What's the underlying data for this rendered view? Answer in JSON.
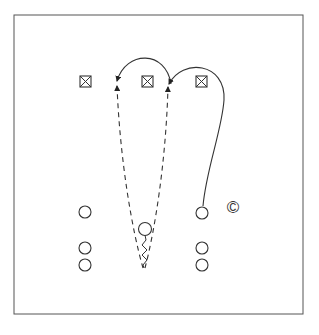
{
  "diagram": {
    "type": "play-diagram",
    "frame": {
      "x": 14,
      "y": 15,
      "width": 289,
      "height": 299,
      "stroke": "#555555"
    },
    "defenders": [
      {
        "id": "d1",
        "symbol": "boxed-x",
        "x": 85.5,
        "y": 81.5
      },
      {
        "id": "d2",
        "symbol": "boxed-x",
        "x": 147.5,
        "y": 81.5
      },
      {
        "id": "d3",
        "symbol": "boxed-x",
        "x": 201.5,
        "y": 81.5
      }
    ],
    "players": [
      {
        "id": "left-1",
        "x": 85,
        "y": 212
      },
      {
        "id": "left-2",
        "x": 85,
        "y": 248
      },
      {
        "id": "left-3",
        "x": 85,
        "y": 265
      },
      {
        "id": "center",
        "x": 145,
        "y": 229
      },
      {
        "id": "right-1",
        "x": 202,
        "y": 213
      },
      {
        "id": "right-2",
        "x": 202,
        "y": 248
      },
      {
        "id": "right-3",
        "x": 202,
        "y": 265
      }
    ],
    "coach_marker": {
      "label": "©",
      "x": 233,
      "y": 207
    },
    "routes": [
      {
        "id": "dashed-left",
        "style": "dashed",
        "from": [
          143,
          268
        ],
        "to": [
          117,
          84
        ]
      },
      {
        "id": "dashed-right",
        "style": "dashed",
        "from": [
          145,
          268
        ],
        "to": [
          168,
          85
        ]
      },
      {
        "id": "arc-left",
        "style": "solid-arrow",
        "from": [
          171,
          84
        ],
        "to": [
          117,
          82
        ]
      },
      {
        "id": "solid-right",
        "style": "solid-arrow",
        "from": [
          203,
          206
        ],
        "to": [
          168,
          85
        ]
      },
      {
        "id": "dribble",
        "style": "zigzag",
        "from": [
          145,
          235
        ],
        "to": [
          144,
          268
        ]
      }
    ]
  }
}
